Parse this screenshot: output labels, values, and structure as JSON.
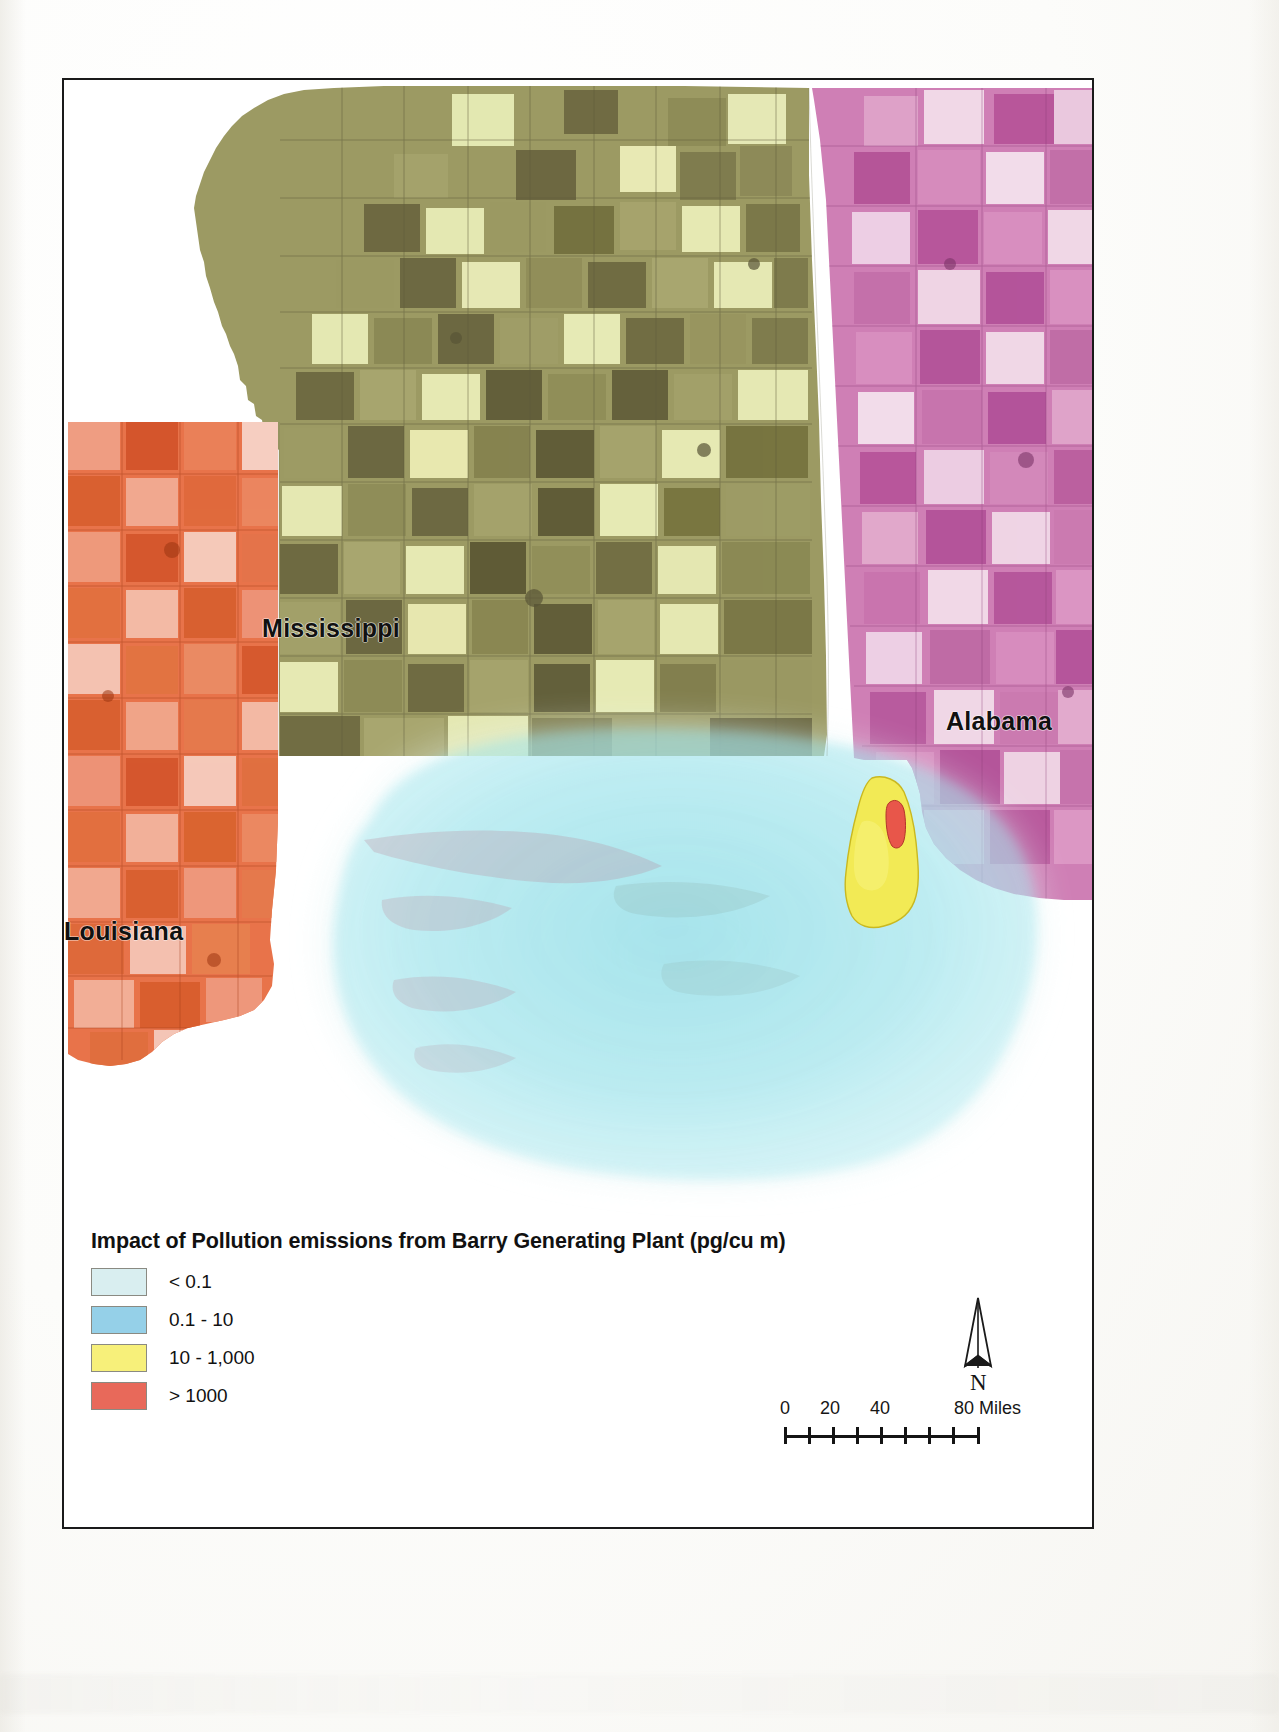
{
  "map": {
    "frame_border_color": "#1a1a1a",
    "state_labels": [
      {
        "name": "Mississippi",
        "text": "Mississippi"
      },
      {
        "name": "Alabama",
        "text": "Alabama"
      },
      {
        "name": "Louisiana",
        "text": "Louisiana"
      }
    ],
    "state_fills": {
      "mississippi_base": "#9c9a63",
      "mississippi_light": "#e9ecb8",
      "mississippi_dark": "#6a6440",
      "alabama_base": "#cf7fb5",
      "alabama_light": "#f3dcea",
      "alabama_dark": "#b8559a",
      "louisiana_base": "#e8734a",
      "louisiana_light": "#f6cfc2",
      "louisiana_dark": "#d4552b"
    },
    "plume": {
      "outer_halo_color": "#dff2f3",
      "inner_plume_color": "#8fe0ea",
      "hotspot_yellow": "#f5ee55",
      "hotspot_red": "#e8594a"
    }
  },
  "legend": {
    "title": "Impact of Pollution emissions from Barry Generating Plant (pg/cu m)",
    "items": [
      {
        "label": "< 0.1",
        "color": "#d9eef0"
      },
      {
        "label": "0.1 - 10",
        "color": "#95d0e8"
      },
      {
        "label": "10 - 1,000",
        "color": "#f7f07a"
      },
      {
        "label": "> 1000",
        "color": "#e8695a"
      }
    ]
  },
  "scalebar": {
    "ticks": [
      "0",
      "20",
      "40",
      "80"
    ],
    "units": "80 Miles",
    "t0": "0",
    "t20": "20",
    "t40": "40",
    "t80": "80 Miles"
  },
  "north_arrow": {
    "letter": "N"
  }
}
